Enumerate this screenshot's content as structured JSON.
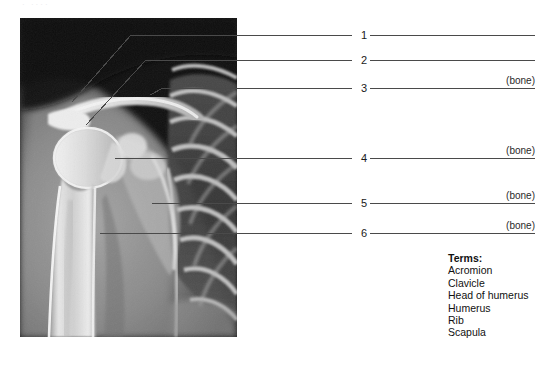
{
  "worksheet": {
    "header_remnant": "·    ····",
    "xray_alt": "anteroposterior radiograph of right shoulder and upper thorax"
  },
  "labels": [
    {
      "number": "1",
      "bone_tag": "",
      "target": "acromion"
    },
    {
      "number": "2",
      "bone_tag": "",
      "target": "head-of-humerus"
    },
    {
      "number": "3",
      "bone_tag": "(bone)",
      "target": "clavicle"
    },
    {
      "number": "4",
      "bone_tag": "(bone)",
      "target": "scapula"
    },
    {
      "number": "5",
      "bone_tag": "(bone)",
      "target": "rib"
    },
    {
      "number": "6",
      "bone_tag": "(bone)",
      "target": "humerus"
    }
  ],
  "terms": {
    "title": "Terms:",
    "items": [
      "Acromion",
      "Clavicle",
      "Head of humerus",
      "Humerus",
      "Rib",
      "Scapula"
    ]
  },
  "colors": {
    "line": "#4a4a4a",
    "text": "#111111",
    "page_background": "#ffffff",
    "film_background": "#0d0d0d"
  }
}
